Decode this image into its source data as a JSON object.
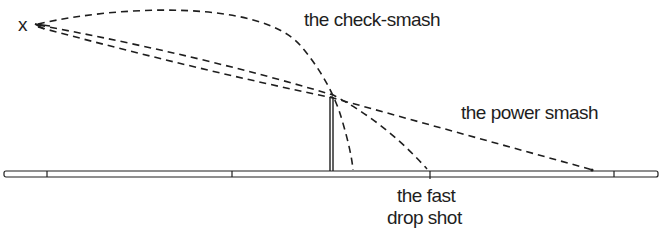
{
  "diagram": {
    "origin_marker": "x",
    "labels": {
      "check_smash": "the check-smash",
      "power_smash": "the power smash",
      "fast_drop_shot_line1": "the fast",
      "fast_drop_shot_line2": "drop shot"
    },
    "colors": {
      "ink": "#1e1e1e",
      "background": "#ffffff"
    },
    "elements": {
      "court": "badminton court floor (side view) with court lines",
      "net": "net post at center",
      "trajectories": [
        "check-smash",
        "power smash",
        "fast drop shot"
      ]
    }
  }
}
